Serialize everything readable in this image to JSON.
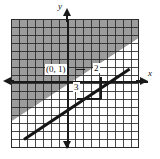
{
  "figure": {
    "type": "coordinate-graph",
    "axes": {
      "x_label": "x",
      "y_label": "y"
    },
    "annotations": {
      "intercept_point": "(0, 1)",
      "rise": "2",
      "run": "3"
    },
    "colors": {
      "shading": "#9c9c9c",
      "grid": "#282828",
      "line": "#151515",
      "background": "#ffffff"
    }
  },
  "chart_data": {
    "type": "line",
    "title": "",
    "xlabel": "x",
    "ylabel": "y",
    "grid": true,
    "legend": "none",
    "xlim": [
      -7,
      9
    ],
    "ylim": [
      -8,
      8
    ],
    "series": [
      {
        "name": "boundary line",
        "kind": "line",
        "slope": 0.6667,
        "intercept": 1,
        "equation": "y = (2/3)x + 1",
        "style": "solid",
        "x": [
          -7,
          9
        ],
        "y": [
          -3.67,
          7
        ]
      }
    ],
    "shaded_region": {
      "side": "above",
      "inequality": "y >= (2/3)x + 1",
      "fill": "#9c9c9c"
    },
    "annotations": [
      {
        "text": "(0, 1)",
        "x": 0,
        "y": 1,
        "role": "y-intercept"
      },
      {
        "text": "2",
        "x": 3,
        "y": 2,
        "role": "rise"
      },
      {
        "text": "3",
        "x": 1.5,
        "y": 0,
        "role": "run"
      }
    ]
  }
}
